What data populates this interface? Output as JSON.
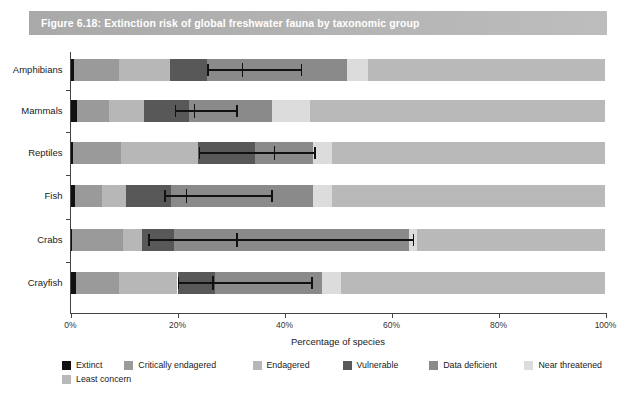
{
  "figure": {
    "title": "Figure 6.18: Extinction risk of global freshwater fauna by taxonomic group",
    "banner_color": "#b0b0b0",
    "title_color": "#ffffff"
  },
  "axis": {
    "xlabel": "Percentage of species",
    "xticks": [
      "0%",
      "20%",
      "40%",
      "60%",
      "80%",
      "100%"
    ],
    "xtick_values": [
      0,
      20,
      40,
      60,
      80,
      100
    ],
    "xlim": [
      0,
      100
    ],
    "grid": false
  },
  "legend": {
    "position": "bottom-left",
    "items": [
      {
        "label": "Extinct",
        "color": "#111111"
      },
      {
        "label": "Critically endagered",
        "color": "#9a9a9a"
      },
      {
        "label": "Endagered",
        "color": "#b7b7b7"
      },
      {
        "label": "Vulnerable",
        "color": "#585858"
      },
      {
        "label": "Data deficient",
        "color": "#8a8a8a"
      },
      {
        "label": "Near threatened",
        "color": "#dcdcdc"
      },
      {
        "label": "Least concern",
        "color": "#b9b9b9"
      }
    ]
  },
  "chart_data": {
    "type": "bar",
    "orientation": "horizontal",
    "stacked": true,
    "title": "Figure 6.18: Extinction risk of global freshwater fauna by taxonomic group",
    "xlabel": "Percentage of species",
    "ylabel": "",
    "xlim": [
      0,
      100
    ],
    "categories": [
      "Amphibians",
      "Mammals",
      "Reptiles",
      "Fish",
      "Crabs",
      "Crayfish"
    ],
    "series": [
      {
        "name": "Extinct",
        "color": "#111111",
        "values": [
          0.6,
          1.2,
          0.4,
          0.8,
          0.3,
          1.0
        ]
      },
      {
        "name": "Critically endagered",
        "color": "#9a9a9a",
        "values": [
          8.5,
          6.0,
          9.0,
          5.0,
          9.5,
          8.0
        ]
      },
      {
        "name": "Endagered",
        "color": "#b7b7b7",
        "values": [
          9.5,
          6.5,
          14.5,
          4.5,
          3.5,
          11.0
        ]
      },
      {
        "name": "Vulnerable",
        "color": "#585858",
        "values": [
          7.0,
          8.5,
          10.5,
          8.5,
          6.0,
          7.0
        ]
      },
      {
        "name": "Data deficient",
        "color": "#8a8a8a",
        "values": [
          26.0,
          15.5,
          11.0,
          26.5,
          44.0,
          20.0
        ]
      },
      {
        "name": "Near threatened",
        "color": "#dcdcdc",
        "values": [
          4.0,
          7.0,
          3.5,
          3.5,
          1.5,
          3.5
        ]
      },
      {
        "name": "Least concern",
        "color": "#b9b9b9",
        "values": [
          44.4,
          55.3,
          51.1,
          51.2,
          35.2,
          49.5
        ]
      }
    ],
    "error_bars": {
      "description": "Best estimate of percentage threatened with lower and upper bounds",
      "values": [
        {
          "category": "Amphibians",
          "low": 25.5,
          "best": 32.0,
          "high": 43.0
        },
        {
          "category": "Mammals",
          "low": 19.5,
          "best": 23.0,
          "high": 31.0
        },
        {
          "category": "Reptiles",
          "low": 24.0,
          "best": 38.0,
          "high": 45.5
        },
        {
          "category": "Fish",
          "low": 17.5,
          "best": 21.5,
          "high": 37.5
        },
        {
          "category": "Crabs",
          "low": 14.5,
          "best": 31.0,
          "high": 64.0
        },
        {
          "category": "Crayfish",
          "low": 20.0,
          "best": 26.5,
          "high": 45.0
        }
      ]
    }
  }
}
